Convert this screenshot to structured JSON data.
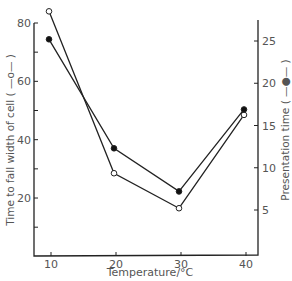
{
  "chart_data": {
    "type": "line",
    "title": "",
    "xlabel": "Temperature/°C",
    "ylabel_left": "Time to fall width of cell ( —o— )",
    "ylabel_right": "Presentation time ( —●— )",
    "x": [
      10,
      20,
      30,
      40
    ],
    "x_ticks": [
      "10",
      "20",
      "30",
      "40"
    ],
    "y_left_ticks": [
      "20",
      "40",
      "60",
      "80"
    ],
    "y_right_ticks": [
      "5",
      "10",
      "15",
      "20",
      "25"
    ],
    "ylim_left": [
      0,
      85
    ],
    "ylim_right": [
      0,
      27
    ],
    "grid": false,
    "series": [
      {
        "name": "Time to fall width of cell",
        "marker": "open-circle",
        "axis": "left",
        "values": [
          84,
          28.5,
          16.5,
          48.5
        ]
      },
      {
        "name": "Presentation time",
        "marker": "filled-circle",
        "axis": "right",
        "values": [
          25.2,
          12.3,
          7.2,
          16.9
        ]
      }
    ]
  },
  "labels": {
    "xlabel": "Temperature/°C",
    "ylabel_left": "Time to fall width of cell ( —o— )",
    "ylabel_right": "Presentation time ( —●— )"
  },
  "colors": {
    "axis": "#222222",
    "text": "#555555",
    "line": "#222222"
  }
}
